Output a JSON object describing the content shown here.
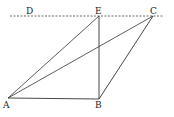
{
  "diagram": {
    "labels": {
      "A": "A",
      "B": "B",
      "C": "C",
      "D": "D",
      "E": "E"
    },
    "points": {
      "A": [
        8,
        98
      ],
      "B": [
        99,
        99
      ],
      "C": [
        153,
        16
      ],
      "E": [
        99,
        16
      ],
      "D": [
        29,
        16
      ]
    },
    "segments": [
      "AB",
      "AE",
      "AC",
      "EB",
      "BC"
    ],
    "dashed_line": {
      "label": "DC",
      "from_x": 10,
      "to_x": 163,
      "y": 16
    },
    "colors": {
      "line": "#333333",
      "background": "#ffffff"
    }
  }
}
